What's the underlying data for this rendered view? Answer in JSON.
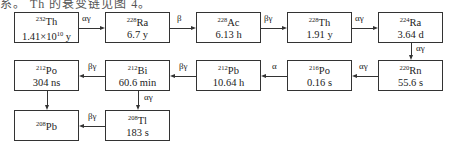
{
  "caption": "系。 Th 的衰变链见图 4。",
  "nodes": [
    {
      "id": "th232",
      "mass": "232",
      "symbol": "Th",
      "half_life": "1.41×10",
      "exp": "10",
      "unit": " y"
    },
    {
      "id": "ra228",
      "mass": "228",
      "symbol": "Ra",
      "half_life": "6.7 y"
    },
    {
      "id": "ac228",
      "mass": "228",
      "symbol": "Ac",
      "half_life": "6.13 h"
    },
    {
      "id": "th228",
      "mass": "228",
      "symbol": "Th",
      "half_life": "1.91 y"
    },
    {
      "id": "ra224",
      "mass": "224",
      "symbol": "Ra",
      "half_life": "3.64 d"
    },
    {
      "id": "rn220",
      "mass": "220",
      "symbol": "Rn",
      "half_life": "55.6 s"
    },
    {
      "id": "po216",
      "mass": "216",
      "symbol": "Po",
      "half_life": "0.16 s"
    },
    {
      "id": "pb212",
      "mass": "212",
      "symbol": "Pb",
      "half_life": "10.64 h"
    },
    {
      "id": "bi212",
      "mass": "212",
      "symbol": "Bi",
      "half_life": "60.6 min"
    },
    {
      "id": "po212",
      "mass": "212",
      "symbol": "Po",
      "half_life": "304 ns"
    },
    {
      "id": "tl208",
      "mass": "208",
      "symbol": "Tl",
      "half_life": "183 s"
    },
    {
      "id": "pb208",
      "mass": "208",
      "symbol": "Pb",
      "half_life": ""
    }
  ],
  "edges": [
    {
      "from": "th232",
      "to": "ra228",
      "label": "αγ"
    },
    {
      "from": "ra228",
      "to": "ac228",
      "label": "β"
    },
    {
      "from": "ac228",
      "to": "th228",
      "label": "βγ"
    },
    {
      "from": "th228",
      "to": "ra224",
      "label": "αγ"
    },
    {
      "from": "ra224",
      "to": "rn220",
      "label": "αγ"
    },
    {
      "from": "rn220",
      "to": "po216",
      "label": "αγ"
    },
    {
      "from": "po216",
      "to": "pb212",
      "label": "α"
    },
    {
      "from": "pb212",
      "to": "bi212",
      "label": "βγ"
    },
    {
      "from": "bi212",
      "to": "po212",
      "label": "βγ"
    },
    {
      "from": "bi212",
      "to": "tl208",
      "label": "αγ"
    },
    {
      "from": "po212",
      "to": "pb208",
      "label": ""
    },
    {
      "from": "tl208",
      "to": "pb208",
      "label": "βγ"
    }
  ]
}
